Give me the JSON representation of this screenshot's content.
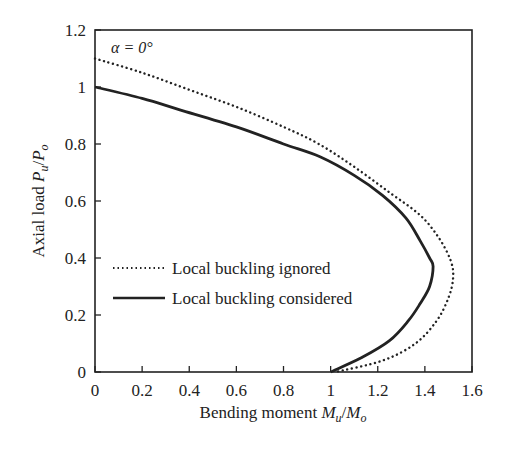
{
  "chart_data": {
    "type": "line",
    "title": "",
    "annotation": "α = 0°",
    "xlabel": "Bending moment Mu/Mo",
    "xlabel_parts": {
      "prefix": "Bending moment ",
      "sym1": "M",
      "sub1": "u",
      "slash": "/",
      "sym2": "M",
      "sub2": "o"
    },
    "ylabel": "Axial load Pu/Po",
    "ylabel_parts": {
      "prefix": "Axial load ",
      "sym1": "P",
      "sub1": "u",
      "slash": "/",
      "sym2": "P",
      "sub2": "o"
    },
    "xlim": [
      0,
      1.6
    ],
    "ylim": [
      0,
      1.2
    ],
    "xticks": [
      "0",
      "0.2",
      "0.4",
      "0.6",
      "0.8",
      "1",
      "1.2",
      "1.4",
      "1.6"
    ],
    "yticks": [
      "0",
      "0.2",
      "0.4",
      "0.6",
      "0.8",
      "1",
      "1.2"
    ],
    "grid": false,
    "legend_position": "lower-left inside",
    "series": [
      {
        "name": "Local buckling ignored",
        "style": "dotted",
        "color": "#222222",
        "points": [
          [
            0,
            1.1
          ],
          [
            0.2,
            1.05
          ],
          [
            0.4,
            0.99
          ],
          [
            0.6,
            0.93
          ],
          [
            0.8,
            0.86
          ],
          [
            0.95,
            0.8
          ],
          [
            1.1,
            0.72
          ],
          [
            1.25,
            0.63
          ],
          [
            1.38,
            0.55
          ],
          [
            1.46,
            0.47
          ],
          [
            1.51,
            0.39
          ],
          [
            1.52,
            0.33
          ],
          [
            1.5,
            0.26
          ],
          [
            1.45,
            0.18
          ],
          [
            1.36,
            0.1
          ],
          [
            1.22,
            0.04
          ],
          [
            1.02,
            0.0
          ]
        ]
      },
      {
        "name": "Local buckling considered",
        "style": "solid",
        "color": "#222222",
        "points": [
          [
            0,
            1.0
          ],
          [
            0.2,
            0.96
          ],
          [
            0.36,
            0.92
          ],
          [
            0.6,
            0.86
          ],
          [
            0.8,
            0.8
          ],
          [
            0.955,
            0.755
          ],
          [
            1.1,
            0.69
          ],
          [
            1.22,
            0.62
          ],
          [
            1.32,
            0.54
          ],
          [
            1.38,
            0.46
          ],
          [
            1.42,
            0.4
          ],
          [
            1.435,
            0.37
          ],
          [
            1.42,
            0.3
          ],
          [
            1.38,
            0.24
          ],
          [
            1.33,
            0.18
          ],
          [
            1.25,
            0.11
          ],
          [
            1.13,
            0.05
          ],
          [
            1.0,
            0.0
          ]
        ]
      }
    ]
  },
  "legend": {
    "items": [
      {
        "label": "Local buckling ignored",
        "style": "dotted"
      },
      {
        "label": "Local buckling considered",
        "style": "solid"
      }
    ]
  }
}
